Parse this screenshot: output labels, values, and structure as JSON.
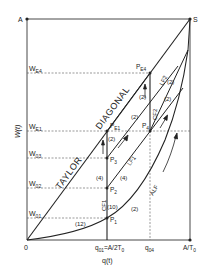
{
  "diagram": {
    "corners": {
      "A": "A",
      "S": "S"
    },
    "axes": {
      "x_label": "q(t)",
      "y_label": "W(t)",
      "origin": "0",
      "x_ticks": [
        "q01=A/2T0",
        "q04",
        "A/T0"
      ],
      "y_ticks": [
        "WE4",
        "WE1",
        "W03",
        "W02",
        "W01"
      ]
    },
    "x_tick_parts": {
      "q01_main": "q",
      "q01_sub": "01",
      "q01_eq": "=A/2T",
      "q01_sub2": "0",
      "q04_main": "q",
      "q04_sub": "04",
      "at0_main": "A/T",
      "at0_sub": "0"
    },
    "y_tick_parts": {
      "we4": {
        "main": "W",
        "sub": "E4"
      },
      "we1": {
        "main": "W",
        "sub": "E1"
      },
      "w03": {
        "main": "W",
        "sub": "03"
      },
      "w02": {
        "main": "W",
        "sub": "02"
      },
      "w01": {
        "main": "W",
        "sub": "01"
      }
    },
    "points": {
      "pe4": {
        "main": "P",
        "sub": "E4"
      },
      "pe1": {
        "main": "P",
        "sub": "E1"
      },
      "p4": {
        "main": "P",
        "sub": "4"
      },
      "p3": {
        "main": "P",
        "sub": "3"
      },
      "p2": {
        "main": "P",
        "sub": "2"
      },
      "p1": {
        "main": "P",
        "sub": "1"
      }
    },
    "curve_labels": {
      "taylor": "TAYLOR",
      "diagonal": "DIAGONAL",
      "lf1": "LF1",
      "lf2": "LF2",
      "cf1": "CF1",
      "cf2": "CF2",
      "alf": "ALF"
    },
    "segment_values": {
      "v12": "(12)",
      "v10": "(10)",
      "v2_alf": "(2)",
      "v4_left": "(4)",
      "v4_lf1": "(4)",
      "v2_pe1": "(2)",
      "v2_mid": "(2)",
      "v2_upper_left": "(2)",
      "v2_lf2": "(2)",
      "v2_right": "(2)"
    },
    "colors": {
      "line": "#222222",
      "grid": "#444444",
      "background": "#ffffff"
    }
  }
}
